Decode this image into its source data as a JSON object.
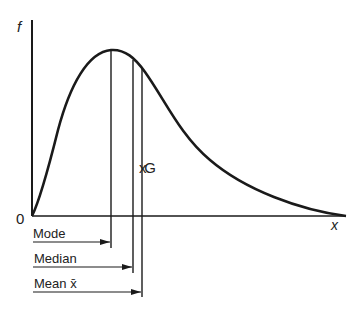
{
  "diagram": {
    "axis_y_label": "f",
    "axis_x_label": "x",
    "origin_label": "0",
    "centroid_label": "xG",
    "markers": [
      {
        "name": "mode",
        "label": "Mode"
      },
      {
        "name": "median",
        "label": "Median"
      },
      {
        "name": "mean",
        "label": "Mean x̄"
      }
    ],
    "colors": {
      "stroke": "#1a1a1a",
      "background": "#ffffff"
    }
  }
}
